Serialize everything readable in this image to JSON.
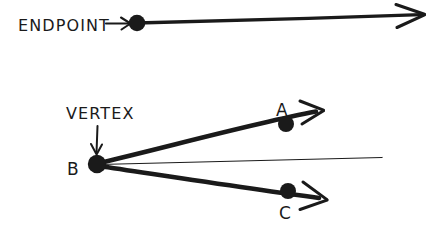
{
  "figure": {
    "style": "hand-drawn ink line art",
    "background_color": "#ffffff",
    "ink_color": "#1a1a1a",
    "width": 434,
    "height": 231
  },
  "diagrams": [
    {
      "id": "ray-endpoint",
      "name": "ray-with-endpoint",
      "annotation": {
        "label": "ENDPOINT",
        "label_x": 18,
        "label_y": 31,
        "pointer": {
          "from_x": 106,
          "from_y": 23,
          "to_x": 131,
          "to_y": 23
        }
      },
      "dot": {
        "label": "",
        "x": 137,
        "y": 23,
        "r": 8
      },
      "ray": {
        "x1": 137,
        "y1": 23,
        "x2": 420,
        "y2": 15,
        "stroke_width": 3.4
      },
      "arrowhead": {
        "tip_x": 424,
        "tip_y": 14,
        "size": 26
      }
    },
    {
      "id": "angle-abc",
      "name": "angle-with-vertex",
      "annotation": {
        "label": "VERTEX",
        "label_x": 66,
        "label_y": 119,
        "pointer": {
          "from_x": 98,
          "from_y": 126,
          "to_x": 96,
          "to_y": 155
        }
      },
      "vertex": {
        "label": "B",
        "label_x": 67,
        "label_y": 175,
        "x": 97,
        "y": 164,
        "r": 9
      },
      "rays": [
        {
          "name": "ray-ba",
          "point": {
            "label": "A",
            "label_x": 276,
            "label_y": 116,
            "x": 286,
            "y": 124,
            "r": 8
          },
          "x1": 97,
          "y1": 164,
          "x2": 315,
          "y2": 112,
          "stroke_width": 4.6,
          "arrowhead": {
            "tip_x": 322,
            "tip_y": 110,
            "size": 24
          }
        },
        {
          "name": "ray-bc",
          "point": {
            "label": "C",
            "label_x": 279,
            "label_y": 219,
            "x": 288,
            "y": 191,
            "r": 8
          },
          "x1": 97,
          "y1": 164,
          "x2": 318,
          "y2": 198,
          "stroke_width": 4.6,
          "arrowhead": {
            "tip_x": 326,
            "tip_y": 200,
            "size": 25
          }
        }
      ],
      "reference_line": {
        "x1": 99,
        "y1": 164,
        "x2": 382,
        "y2": 157,
        "stroke_width": 1.2
      }
    }
  ]
}
